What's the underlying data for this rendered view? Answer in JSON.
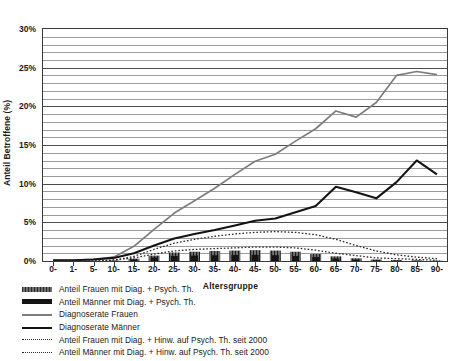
{
  "chart_data": {
    "type": "line",
    "title": "",
    "xlabel": "Altersgruppe",
    "ylabel": "Anteil Betroffene (%)",
    "ylim": [
      0,
      30
    ],
    "ytick_labels": [
      "0%",
      "5%",
      "10%",
      "15%",
      "20%",
      "25%",
      "30%"
    ],
    "ytick_values": [
      0,
      5,
      10,
      15,
      20,
      25,
      30
    ],
    "yminor_step": 1,
    "grid": true,
    "legend_position": "below-left",
    "categories": [
      "0-",
      "1-",
      "5-",
      "10-",
      "15-",
      "20-",
      "25-",
      "30-",
      "35-",
      "40-",
      "45-",
      "50-",
      "55-",
      "60-",
      "65-",
      "70-",
      "75-",
      "80-",
      "85-",
      "90-"
    ],
    "series": [
      {
        "name": "Diagnoserate Frauen",
        "style": "line-gray",
        "color": "#7d7d7d",
        "values": [
          0.1,
          0.1,
          0.2,
          0.5,
          1.9,
          4.1,
          6.2,
          7.8,
          9.4,
          11.2,
          12.9,
          13.8,
          15.5,
          17.1,
          19.4,
          18.6,
          20.5,
          24.0,
          24.5,
          24.1
        ]
      },
      {
        "name": "Diagnoserate Männer",
        "style": "line-black",
        "color": "#141414",
        "values": [
          0.1,
          0.1,
          0.2,
          0.4,
          1.0,
          2.0,
          2.9,
          3.5,
          4.0,
          4.6,
          5.2,
          5.5,
          6.3,
          7.1,
          9.6,
          8.9,
          8.1,
          10.2,
          13.0,
          11.2
        ]
      },
      {
        "name": "Anteil Frauen mit Diag. + Hinw. auf Psych. Th. seit 2000",
        "style": "dotted-upper",
        "color": "#2a2a2a",
        "values": [
          0.0,
          0.0,
          0.0,
          0.1,
          0.6,
          1.5,
          2.3,
          2.8,
          3.2,
          3.5,
          3.7,
          3.8,
          3.7,
          3.4,
          2.8,
          2.0,
          1.3,
          0.8,
          0.5,
          0.3
        ]
      },
      {
        "name": "Anteil Männer mit Diag. + Hinw. auf Psych. Th. seit 2000",
        "style": "dotted-lower",
        "color": "#2a2a2a",
        "values": [
          0.0,
          0.0,
          0.0,
          0.1,
          0.4,
          0.9,
          1.3,
          1.5,
          1.6,
          1.7,
          1.8,
          1.8,
          1.7,
          1.4,
          1.0,
          0.7,
          0.4,
          0.3,
          0.2,
          0.1
        ]
      },
      {
        "name": "Anteil Frauen mit Diag. + Psych. Th.",
        "style": "bar-hatched",
        "color": "#6e6e6e",
        "values": [
          0.0,
          0.0,
          0.0,
          0.05,
          0.3,
          0.7,
          1.1,
          1.2,
          1.3,
          1.35,
          1.4,
          1.35,
          1.2,
          0.9,
          0.6,
          0.35,
          0.2,
          0.12,
          0.08,
          0.05
        ]
      },
      {
        "name": "Anteil Männer mit Diag. + Psych. Th.",
        "style": "bar-black",
        "color": "#141414",
        "values": [
          0.0,
          0.0,
          0.0,
          0.03,
          0.2,
          0.45,
          0.65,
          0.7,
          0.75,
          0.78,
          0.8,
          0.75,
          0.65,
          0.5,
          0.32,
          0.18,
          0.1,
          0.06,
          0.04,
          0.02
        ]
      }
    ]
  },
  "axis": {
    "y_title": "Anteil Betroffene (%)",
    "x_title": "Altersgruppe"
  },
  "legend": {
    "items": [
      {
        "label": "Anteil Frauen mit Diag. + Psych. Th.",
        "swatch": "hatched-band-swatch"
      },
      {
        "label": "Anteil Männer mit Diag. + Psych. Th.",
        "swatch": "solid-black-band-swatch"
      },
      {
        "label": "Diagnoserate Frauen",
        "swatch": "gray-line-swatch"
      },
      {
        "label": "Diagnoserate Männer",
        "swatch": "black-line-swatch"
      },
      {
        "label": "Anteil Frauen mit Diag. + Hinw. auf Psych. Th. seit 2000",
        "swatch": "dotted-line-swatch"
      },
      {
        "label": "Anteil Männer mit Diag. + Hinw. auf Psych. Th. seit 2000",
        "swatch": "dotted-line-swatch"
      }
    ]
  }
}
